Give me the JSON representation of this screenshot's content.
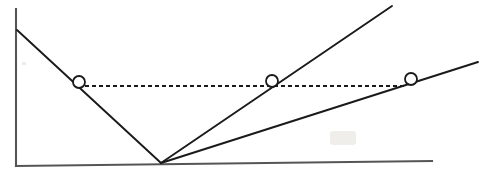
{
  "figure": {
    "title": "",
    "background_color": "#ffffff",
    "ink_color": "#1a1a1a",
    "axis_color": "#555555",
    "smudge_color": "#d8d5cf",
    "width": 492,
    "height": 178
  },
  "chart_data": {
    "type": "line",
    "title": "",
    "xlabel": "",
    "ylabel": "",
    "xlim": [
      0,
      492
    ],
    "ylim": [
      178,
      0
    ],
    "grid": false,
    "legend": "none",
    "axes": {
      "y_axis": {
        "label": "y-axis",
        "x1": 16,
        "y1": 9,
        "x2": 16,
        "y2": 166
      },
      "x_axis": {
        "label": "x-axis",
        "x1": 16,
        "y1": 166,
        "x2": 432,
        "y2": 161
      }
    },
    "series": [
      {
        "name": "descending-branch",
        "style": "solid",
        "points": [
          [
            17,
            30
          ],
          [
            161,
            163
          ]
        ]
      },
      {
        "name": "steep-ascending-branch",
        "style": "solid",
        "points": [
          [
            161,
            163
          ],
          [
            392,
            6
          ]
        ]
      },
      {
        "name": "shallow-ascending-branch",
        "style": "solid",
        "points": [
          [
            161,
            163
          ],
          [
            478,
            62
          ]
        ]
      },
      {
        "name": "horizontal-level-line",
        "style": "dashed",
        "dash_pattern": "4 3",
        "points": [
          [
            85,
            86
          ],
          [
            407,
            86
          ]
        ]
      }
    ],
    "markers": [
      {
        "name": "marker-1",
        "shape": "open-circle",
        "x": 79,
        "y": 82,
        "r": 6
      },
      {
        "name": "marker-2",
        "shape": "open-circle",
        "x": 272,
        "y": 81,
        "r": 6
      },
      {
        "name": "marker-3",
        "shape": "open-circle",
        "x": 411,
        "y": 79,
        "r": 6
      }
    ],
    "annotations": [
      {
        "name": "paper-smudge",
        "x": 330,
        "y": 131,
        "width": 26,
        "height": 14
      }
    ]
  }
}
